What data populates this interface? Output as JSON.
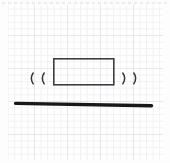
{
  "sheet": {
    "title": "graph paper sketch",
    "background_color": "#ffffff",
    "grid_minor_color": "#f1f1f3",
    "grid_major_color": "#e7e7ea",
    "grid_minor_spacing_px": 6.6,
    "grid_major_spacing_px": 33
  },
  "drawing": {
    "name": "block-on-surface-sketch",
    "description": "A rectangle resting above a thick horizontal line, with two curved motion marks on each side",
    "stroke_color_rect": "#3e3e42",
    "stroke_color_line": "#18181a",
    "stroke_color_marks": "#343438",
    "elements": [
      {
        "name": "block-rectangle",
        "shape": "rect",
        "x": 53,
        "y": 58,
        "width": 61,
        "height": 27,
        "stroke_width": 1.6
      },
      {
        "name": "ground-line",
        "shape": "line",
        "x1": 15,
        "y1": 103,
        "x2": 152,
        "y2": 106,
        "stroke_width": 3.4
      },
      {
        "name": "motion-mark-left-outer",
        "shape": "arc",
        "glyph": "(",
        "cx": 31,
        "cy": 78
      },
      {
        "name": "motion-mark-left-inner",
        "shape": "arc",
        "glyph": "(",
        "cx": 42,
        "cy": 78
      },
      {
        "name": "motion-mark-right-inner",
        "shape": "arc",
        "glyph": ")",
        "cx": 125,
        "cy": 78
      },
      {
        "name": "motion-mark-right-outer",
        "shape": "arc",
        "glyph": ")",
        "cx": 136,
        "cy": 78
      }
    ]
  }
}
